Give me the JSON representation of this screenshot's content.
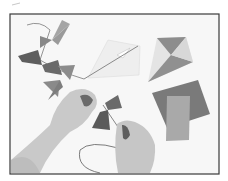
{
  "image": {
    "description": "Grayscale photo of two hands tying paper bows onto a kite tail string, with a paper kite, a folded paper kite and paper squares on a white surface",
    "colorscheme": "grayscale",
    "subjects": [
      "hands",
      "paper bows",
      "kite string",
      "paper kite",
      "folded paper kite",
      "paper squares"
    ]
  }
}
